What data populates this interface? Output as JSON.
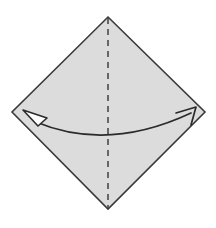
{
  "figure": {
    "title": "Origami step: fold square diagonally along vertical crease",
    "canvas": {
      "width": 216,
      "height": 228,
      "background_color": "#ffffff"
    },
    "paper": {
      "shape_name": "square rotated 45 degrees (diamond)",
      "fill_color": "#dcdcdc",
      "stroke_color": "#3a3a3a",
      "stroke_width": 1.6,
      "points": "108,17 205,112 108,209 12,112",
      "vertices": {
        "top": {
          "x": 108,
          "y": 17
        },
        "right": {
          "x": 205,
          "y": 112
        },
        "bottom": {
          "x": 108,
          "y": 209
        },
        "left": {
          "x": 12,
          "y": 112
        }
      }
    },
    "fold_line": {
      "label": "valley fold crease",
      "orientation": "vertical",
      "style": "dashed",
      "stroke_color": "#4a4a4a",
      "stroke_width": 1.6,
      "dash_pattern": "6 5",
      "x1": 108,
      "y1": 18,
      "x2": 108,
      "y2": 208
    },
    "motion_arrow": {
      "label": "double-headed fold motion arrow",
      "stroke_color": "#2b2b2b",
      "stroke_width": 1.7,
      "path": "M 36,122 Q 108,152 191,113",
      "left_head": {
        "name": "hollow triangle arrowhead pointing up-left",
        "style": "outlined-triangle",
        "fill_color": "#ffffff",
        "stroke_color": "#2b2b2b",
        "points": "23,110 47,118 38,126"
      },
      "right_head": {
        "name": "open line arrowhead pointing up-right",
        "style": "open-v",
        "stroke_color": "#2b2b2b",
        "path": "M 176,113 L 196,107 L 191,125"
      }
    }
  }
}
